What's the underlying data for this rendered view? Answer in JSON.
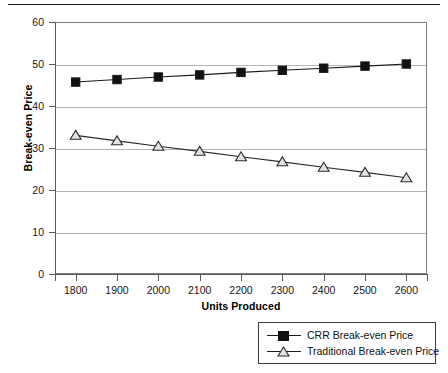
{
  "chart_data": {
    "type": "line",
    "title": "",
    "xlabel": "Units Produced",
    "ylabel": "Break-even Price",
    "x": [
      1800,
      1900,
      2000,
      2100,
      2200,
      2300,
      2400,
      2500,
      2600
    ],
    "categories": [
      "1800",
      "1900",
      "2000",
      "2100",
      "2200",
      "2300",
      "2400",
      "2500",
      "2600"
    ],
    "xlim": [
      1750,
      2650
    ],
    "ylim": [
      0,
      60
    ],
    "y_ticks": [
      0,
      10,
      20,
      30,
      40,
      50,
      60
    ],
    "y_tick_labels": [
      "0",
      "10",
      "20",
      "30",
      "40",
      "50",
      "60"
    ],
    "grid": "horizontal",
    "legend_position": "bottom-right",
    "series": [
      {
        "name": "CRR Break-even Price",
        "marker": "filled-square",
        "color": "#1a1a1a",
        "marker_fill": "#111111",
        "values": [
          45.7,
          46.3,
          46.9,
          47.4,
          48.0,
          48.5,
          49.0,
          49.5,
          50.0
        ]
      },
      {
        "name": "Traditional Break-even Price",
        "marker": "open-triangle",
        "color": "#2b2b2b",
        "marker_fill": "#e2e2e2",
        "values": [
          33.0,
          31.7,
          30.4,
          29.2,
          27.9,
          26.7,
          25.4,
          24.2,
          22.9
        ]
      }
    ]
  },
  "legend": {
    "entries": [
      {
        "label": "CRR Break-even Price"
      },
      {
        "label": "Traditional Break-even Price"
      }
    ]
  },
  "axes": {
    "y_title": "Break-even Price",
    "x_title": "Units Produced"
  },
  "colors": {
    "rule": "#1a1a1a",
    "grid": "#b4b4b4",
    "axis": "#5a5a5a",
    "text": "#111111"
  }
}
